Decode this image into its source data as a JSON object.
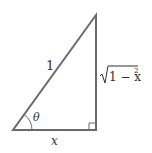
{
  "diagram": {
    "type": "right-triangle",
    "hypotenuse_label": "1",
    "opposite_label": "√1 − x²",
    "opposite_radicand": "1 − x",
    "opposite_exponent": "2",
    "adjacent_label": "x",
    "angle_label": "θ",
    "line_color": "#6a6a6a"
  }
}
